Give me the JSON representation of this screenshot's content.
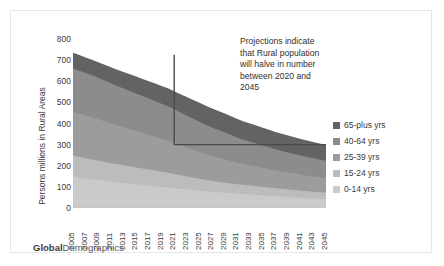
{
  "watermark": {
    "bold": "Global",
    "rest": "Demographics"
  },
  "annotation": {
    "line1": "Projections indicate",
    "line2": "that Rural population",
    "line3": "will halve in number",
    "line4": "between 2020 and",
    "line5": "2045"
  },
  "legend": {
    "position": "right",
    "items": [
      {
        "label": "65-plus yrs",
        "color": "#636363"
      },
      {
        "label": "40-64 yrs",
        "color": "#8c8c8c"
      },
      {
        "label": "25-39 yrs",
        "color": "#9c9c9c"
      },
      {
        "label": "15-24 yrs",
        "color": "#bcbcbc"
      },
      {
        "label": "0-14 yrs",
        "color": "#cacaca"
      }
    ]
  },
  "chart_data": {
    "type": "area",
    "title": "",
    "xlabel": "",
    "ylabel": "Persons millions in Rural Areas",
    "ylim": [
      0,
      800
    ],
    "yticks": [
      0,
      100,
      200,
      300,
      400,
      500,
      600,
      700,
      800
    ],
    "grid": false,
    "stacked": true,
    "categories": [
      2005,
      2006,
      2007,
      2008,
      2009,
      2010,
      2011,
      2012,
      2013,
      2014,
      2015,
      2016,
      2017,
      2018,
      2019,
      2020,
      2021,
      2022,
      2023,
      2024,
      2025,
      2026,
      2027,
      2028,
      2029,
      2030,
      2031,
      2032,
      2033,
      2034,
      2035,
      2036,
      2037,
      2038,
      2039,
      2040,
      2041,
      2042,
      2043,
      2044,
      2045
    ],
    "tick_labels": [
      2005,
      2007,
      2009,
      2011,
      2013,
      2015,
      2017,
      2019,
      2021,
      2023,
      2025,
      2027,
      2029,
      2031,
      2033,
      2035,
      2037,
      2039,
      2041,
      2043,
      2045
    ],
    "series": [
      {
        "name": "0-14 yrs",
        "color": "#cacaca",
        "values": [
          148,
          144,
          140,
          136,
          132,
          128,
          124,
          121,
          118,
          115,
          112,
          109,
          106,
          103,
          100,
          97,
          94,
          91,
          88,
          85,
          82,
          79,
          76,
          74,
          72,
          70,
          68,
          66,
          64,
          62,
          60,
          58,
          56,
          54,
          52,
          50,
          48,
          46,
          45,
          44,
          43
        ]
      },
      {
        "name": "15-24 yrs",
        "color": "#bcbcbc",
        "values": [
          100,
          98,
          96,
          94,
          92,
          90,
          88,
          86,
          84,
          82,
          80,
          78,
          76,
          74,
          72,
          70,
          67,
          64,
          61,
          58,
          56,
          54,
          52,
          50,
          48,
          46,
          44,
          43,
          42,
          41,
          40,
          39,
          38,
          37,
          36,
          35,
          34,
          33,
          32,
          31,
          30
        ]
      },
      {
        "name": "25-39 yrs",
        "color": "#9c9c9c",
        "values": [
          208,
          205,
          202,
          199,
          196,
          192,
          188,
          184,
          180,
          176,
          172,
          168,
          164,
          160,
          156,
          152,
          147,
          142,
          137,
          132,
          127,
          122,
          118,
          114,
          110,
          106,
          102,
          99,
          96,
          93,
          90,
          87,
          84,
          82,
          80,
          78,
          76,
          74,
          72,
          70,
          68
        ]
      },
      {
        "name": "40-64 yrs",
        "color": "#8c8c8c",
        "values": [
          205,
          203,
          201,
          199,
          196,
          193,
          190,
          187,
          184,
          181,
          178,
          175,
          172,
          169,
          166,
          163,
          159,
          155,
          151,
          147,
          143,
          139,
          135,
          131,
          127,
          123,
          119,
          115,
          112,
          109,
          106,
          103,
          100,
          97,
          95,
          93,
          91,
          89,
          87,
          85,
          83
        ]
      },
      {
        "name": "65-plus yrs",
        "color": "#636363",
        "values": [
          74,
          74,
          74,
          74,
          74,
          75,
          76,
          77,
          78,
          79,
          80,
          81,
          82,
          83,
          84,
          85,
          86,
          87,
          88,
          89,
          90,
          90,
          90,
          90,
          90,
          89,
          88,
          87,
          86,
          85,
          84,
          83,
          82,
          81,
          80,
          79,
          78,
          77,
          76,
          75,
          74
        ]
      }
    ],
    "annotation_lines": {
      "vertical_x": 2021,
      "vertical_y_top": 725,
      "horizontal_y": 300,
      "horizontal_x_end": 2045,
      "color": "#4a4a4a"
    }
  }
}
